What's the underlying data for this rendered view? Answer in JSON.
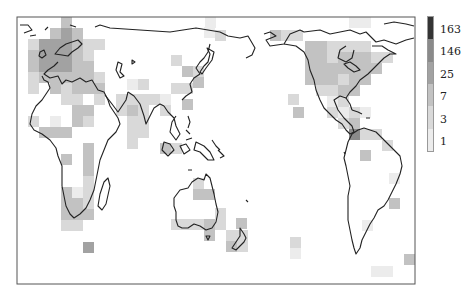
{
  "chart_data": {
    "type": "heatmap",
    "title": "",
    "legend": {
      "position": "right",
      "labels": [
        "163",
        "146",
        "25",
        "7",
        "3",
        "1"
      ],
      "colors": [
        "#343434",
        "#8a8a8a",
        "#a2a2a2",
        "#c2c2c2",
        "#d9d9d9",
        "#ececec"
      ]
    },
    "frame": {
      "x": 17,
      "y": 17,
      "width": 398,
      "height": 267
    },
    "cell_size": 11,
    "cells": [
      {
        "x": 61,
        "y": 17,
        "level": 3
      },
      {
        "x": 50,
        "y": 28,
        "level": 3
      },
      {
        "x": 61,
        "y": 28,
        "level": 2
      },
      {
        "x": 72,
        "y": 28,
        "level": 3
      },
      {
        "x": 28,
        "y": 39,
        "level": 4
      },
      {
        "x": 39,
        "y": 39,
        "level": 2
      },
      {
        "x": 50,
        "y": 39,
        "level": 2
      },
      {
        "x": 61,
        "y": 39,
        "level": 2
      },
      {
        "x": 72,
        "y": 39,
        "level": 3
      },
      {
        "x": 83,
        "y": 39,
        "level": 4
      },
      {
        "x": 94,
        "y": 39,
        "level": 4
      },
      {
        "x": 28,
        "y": 50,
        "level": 3
      },
      {
        "x": 39,
        "y": 50,
        "level": 2
      },
      {
        "x": 50,
        "y": 50,
        "level": 2
      },
      {
        "x": 61,
        "y": 50,
        "level": 2
      },
      {
        "x": 72,
        "y": 50,
        "level": 3
      },
      {
        "x": 83,
        "y": 50,
        "level": 4
      },
      {
        "x": 28,
        "y": 61,
        "level": 3
      },
      {
        "x": 39,
        "y": 61,
        "level": 2
      },
      {
        "x": 50,
        "y": 61,
        "level": 2
      },
      {
        "x": 61,
        "y": 61,
        "level": 2
      },
      {
        "x": 72,
        "y": 61,
        "level": 3
      },
      {
        "x": 83,
        "y": 61,
        "level": 3
      },
      {
        "x": 28,
        "y": 72,
        "level": 4
      },
      {
        "x": 39,
        "y": 72,
        "level": 3
      },
      {
        "x": 50,
        "y": 72,
        "level": 3
      },
      {
        "x": 61,
        "y": 72,
        "level": 3
      },
      {
        "x": 72,
        "y": 72,
        "level": 3
      },
      {
        "x": 83,
        "y": 72,
        "level": 3
      },
      {
        "x": 94,
        "y": 72,
        "level": 4
      },
      {
        "x": 28,
        "y": 83,
        "level": 4
      },
      {
        "x": 50,
        "y": 83,
        "level": 3
      },
      {
        "x": 61,
        "y": 83,
        "level": 4
      },
      {
        "x": 72,
        "y": 83,
        "level": 3
      },
      {
        "x": 83,
        "y": 83,
        "level": 3
      },
      {
        "x": 94,
        "y": 83,
        "level": 3
      },
      {
        "x": 61,
        "y": 94,
        "level": 4
      },
      {
        "x": 72,
        "y": 94,
        "level": 4
      },
      {
        "x": 94,
        "y": 94,
        "level": 4
      },
      {
        "x": 72,
        "y": 105,
        "level": 3
      },
      {
        "x": 83,
        "y": 105,
        "level": 3
      },
      {
        "x": 28,
        "y": 116,
        "level": 4
      },
      {
        "x": 50,
        "y": 116,
        "level": 5
      },
      {
        "x": 72,
        "y": 116,
        "level": 3
      },
      {
        "x": 83,
        "y": 116,
        "level": 4
      },
      {
        "x": 39,
        "y": 127,
        "level": 3
      },
      {
        "x": 50,
        "y": 127,
        "level": 3
      },
      {
        "x": 61,
        "y": 127,
        "level": 3
      },
      {
        "x": 83,
        "y": 143,
        "level": 3
      },
      {
        "x": 61,
        "y": 154,
        "level": 3
      },
      {
        "x": 83,
        "y": 154,
        "level": 3
      },
      {
        "x": 83,
        "y": 165,
        "level": 3
      },
      {
        "x": 83,
        "y": 176,
        "level": 4
      },
      {
        "x": 61,
        "y": 187,
        "level": 3
      },
      {
        "x": 72,
        "y": 187,
        "level": 5
      },
      {
        "x": 83,
        "y": 187,
        "level": 4
      },
      {
        "x": 61,
        "y": 198,
        "level": 3
      },
      {
        "x": 72,
        "y": 198,
        "level": 3
      },
      {
        "x": 83,
        "y": 198,
        "level": 4
      },
      {
        "x": 61,
        "y": 209,
        "level": 3
      },
      {
        "x": 72,
        "y": 209,
        "level": 3
      },
      {
        "x": 83,
        "y": 209,
        "level": 3
      },
      {
        "x": 61,
        "y": 220,
        "level": 4
      },
      {
        "x": 72,
        "y": 220,
        "level": 4
      },
      {
        "x": 83,
        "y": 242,
        "level": 2
      },
      {
        "x": 94,
        "y": 83,
        "level": 3
      },
      {
        "x": 116,
        "y": 94,
        "level": 4
      },
      {
        "x": 127,
        "y": 94,
        "level": 4
      },
      {
        "x": 138,
        "y": 94,
        "level": 4
      },
      {
        "x": 149,
        "y": 94,
        "level": 4
      },
      {
        "x": 160,
        "y": 94,
        "level": 5
      },
      {
        "x": 116,
        "y": 105,
        "level": 4
      },
      {
        "x": 127,
        "y": 105,
        "level": 3
      },
      {
        "x": 138,
        "y": 105,
        "level": 4
      },
      {
        "x": 160,
        "y": 105,
        "level": 4
      },
      {
        "x": 127,
        "y": 79,
        "level": 5
      },
      {
        "x": 138,
        "y": 79,
        "level": 4
      },
      {
        "x": 171,
        "y": 83,
        "level": 4
      },
      {
        "x": 182,
        "y": 83,
        "level": 4
      },
      {
        "x": 127,
        "y": 116,
        "level": 4
      },
      {
        "x": 138,
        "y": 116,
        "level": 4
      },
      {
        "x": 127,
        "y": 127,
        "level": 4
      },
      {
        "x": 138,
        "y": 127,
        "level": 4
      },
      {
        "x": 127,
        "y": 138,
        "level": 4
      },
      {
        "x": 171,
        "y": 55,
        "level": 4
      },
      {
        "x": 182,
        "y": 66,
        "level": 3
      },
      {
        "x": 193,
        "y": 77,
        "level": 3
      },
      {
        "x": 182,
        "y": 99,
        "level": 3
      },
      {
        "x": 193,
        "y": 66,
        "level": 4
      },
      {
        "x": 160,
        "y": 143,
        "level": 3
      },
      {
        "x": 171,
        "y": 143,
        "level": 4
      },
      {
        "x": 204,
        "y": 27,
        "level": 5
      },
      {
        "x": 193,
        "y": 178,
        "level": 4
      },
      {
        "x": 193,
        "y": 189,
        "level": 3
      },
      {
        "x": 204,
        "y": 189,
        "level": 3
      },
      {
        "x": 215,
        "y": 208,
        "level": 4
      },
      {
        "x": 171,
        "y": 219,
        "level": 4
      },
      {
        "x": 182,
        "y": 219,
        "level": 4
      },
      {
        "x": 193,
        "y": 219,
        "level": 4
      },
      {
        "x": 204,
        "y": 219,
        "level": 3
      },
      {
        "x": 215,
        "y": 219,
        "level": 4
      },
      {
        "x": 204,
        "y": 230,
        "level": 3
      },
      {
        "x": 236,
        "y": 218,
        "level": 3
      },
      {
        "x": 226,
        "y": 230,
        "level": 4
      },
      {
        "x": 237,
        "y": 230,
        "level": 4
      },
      {
        "x": 226,
        "y": 241,
        "level": 3
      },
      {
        "x": 237,
        "y": 241,
        "level": 4
      },
      {
        "x": 205,
        "y": 17,
        "level": 5
      },
      {
        "x": 215,
        "y": 30,
        "level": 4
      },
      {
        "x": 270,
        "y": 30,
        "level": 3
      },
      {
        "x": 281,
        "y": 30,
        "level": 4
      },
      {
        "x": 292,
        "y": 30,
        "level": 4
      },
      {
        "x": 349,
        "y": 17,
        "level": 5
      },
      {
        "x": 360,
        "y": 17,
        "level": 5
      },
      {
        "x": 305,
        "y": 41,
        "level": 3
      },
      {
        "x": 316,
        "y": 41,
        "level": 3
      },
      {
        "x": 327,
        "y": 41,
        "level": 4
      },
      {
        "x": 338,
        "y": 41,
        "level": 4
      },
      {
        "x": 349,
        "y": 41,
        "level": 4
      },
      {
        "x": 360,
        "y": 41,
        "level": 4
      },
      {
        "x": 305,
        "y": 52,
        "level": 3
      },
      {
        "x": 316,
        "y": 52,
        "level": 3
      },
      {
        "x": 327,
        "y": 52,
        "level": 4
      },
      {
        "x": 338,
        "y": 52,
        "level": 3
      },
      {
        "x": 349,
        "y": 52,
        "level": 3
      },
      {
        "x": 360,
        "y": 52,
        "level": 3
      },
      {
        "x": 371,
        "y": 52,
        "level": 4
      },
      {
        "x": 382,
        "y": 52,
        "level": 4
      },
      {
        "x": 305,
        "y": 63,
        "level": 3
      },
      {
        "x": 316,
        "y": 63,
        "level": 3
      },
      {
        "x": 327,
        "y": 63,
        "level": 3
      },
      {
        "x": 338,
        "y": 63,
        "level": 3
      },
      {
        "x": 349,
        "y": 63,
        "level": 3
      },
      {
        "x": 360,
        "y": 63,
        "level": 3
      },
      {
        "x": 371,
        "y": 63,
        "level": 3
      },
      {
        "x": 305,
        "y": 74,
        "level": 3
      },
      {
        "x": 316,
        "y": 74,
        "level": 3
      },
      {
        "x": 327,
        "y": 74,
        "level": 3
      },
      {
        "x": 338,
        "y": 74,
        "level": 4
      },
      {
        "x": 349,
        "y": 74,
        "level": 3
      },
      {
        "x": 360,
        "y": 74,
        "level": 3
      },
      {
        "x": 316,
        "y": 85,
        "level": 4
      },
      {
        "x": 327,
        "y": 85,
        "level": 4
      },
      {
        "x": 338,
        "y": 85,
        "level": 3
      },
      {
        "x": 349,
        "y": 85,
        "level": 3
      },
      {
        "x": 327,
        "y": 96,
        "level": 5
      },
      {
        "x": 338,
        "y": 96,
        "level": 4
      },
      {
        "x": 327,
        "y": 107,
        "level": 4
      },
      {
        "x": 338,
        "y": 107,
        "level": 5
      },
      {
        "x": 349,
        "y": 107,
        "level": 4
      },
      {
        "x": 360,
        "y": 107,
        "level": 5
      },
      {
        "x": 338,
        "y": 118,
        "level": 4
      },
      {
        "x": 349,
        "y": 118,
        "level": 3
      },
      {
        "x": 349,
        "y": 129,
        "level": 1
      },
      {
        "x": 360,
        "y": 129,
        "level": 4
      },
      {
        "x": 371,
        "y": 129,
        "level": 4
      },
      {
        "x": 382,
        "y": 140,
        "level": 4
      },
      {
        "x": 360,
        "y": 150,
        "level": 3
      },
      {
        "x": 389,
        "y": 173,
        "level": 5
      },
      {
        "x": 389,
        "y": 198,
        "level": 3
      },
      {
        "x": 362,
        "y": 220,
        "level": 5
      },
      {
        "x": 404,
        "y": 254,
        "level": 3
      },
      {
        "x": 371,
        "y": 266,
        "level": 5
      },
      {
        "x": 382,
        "y": 266,
        "level": 5
      },
      {
        "x": 290,
        "y": 248,
        "level": 5
      },
      {
        "x": 290,
        "y": 237,
        "level": 4
      },
      {
        "x": 293,
        "y": 107,
        "level": 3
      },
      {
        "x": 288,
        "y": 94,
        "level": 4
      }
    ]
  }
}
